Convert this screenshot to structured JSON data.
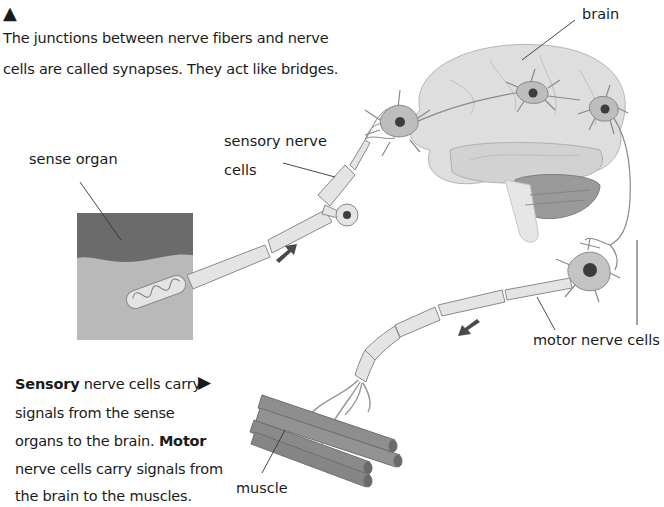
{
  "caption_top": {
    "marker": "▲",
    "line1": "The junctions between nerve fibers and nerve",
    "line2": "cells are called synapses. They act like bridges."
  },
  "caption_bottom": {
    "marker": "▶",
    "line1_bold": "Sensory",
    "line1_rest": " nerve cells carry",
    "line2": "signals from the sense",
    "line3_pre": "organs to the brain. ",
    "line3_bold": "Motor",
    "line4": "nerve cells carry signals from",
    "line5": "the brain to the muscles."
  },
  "labels": {
    "brain": "brain",
    "sense_organ": "sense organ",
    "sensory_line1": "sensory nerve",
    "sensory_line2": "cells",
    "motor": "motor nerve cells",
    "muscle": "muscle"
  },
  "colors": {
    "brain": "#dcdcdc",
    "neuron": "#bdbdbd",
    "nucleus": "#3c3c3c",
    "axon": "#e3e3e3",
    "organ_dark": "#6a6a6a",
    "organ_light": "#b8b8b8",
    "muscle": "#8d8d8d",
    "arrow": "#4a4a4a"
  }
}
